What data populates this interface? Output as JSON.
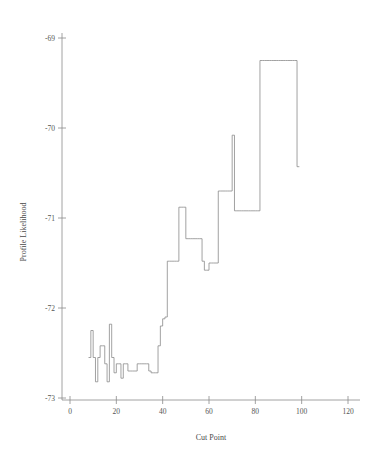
{
  "chart_data": {
    "type": "line",
    "title": "",
    "xlabel": "Cut Point",
    "ylabel": "Profile Likelihood",
    "xlim": [
      -4,
      128
    ],
    "ylim": [
      -73.2,
      -68.8
    ],
    "xticks": [
      0,
      20,
      40,
      60,
      80,
      100,
      120
    ],
    "xticklabels": [
      "0",
      "20",
      "40",
      "60",
      "80",
      "100",
      "120"
    ],
    "yticks": [
      -69,
      -70,
      -71,
      -72,
      -73
    ],
    "yticklabels": [
      "-69",
      "-70",
      "-71",
      "-72",
      "-73"
    ],
    "grid": false,
    "legend": false,
    "line_color": "#8a8a8a",
    "step_style": "post",
    "x": [
      8,
      9,
      10,
      11,
      12,
      13,
      14,
      15,
      16,
      17,
      18,
      19,
      20,
      21,
      22,
      23,
      24,
      25,
      26,
      27,
      28,
      29,
      30,
      31,
      32,
      33,
      34,
      35,
      36,
      37,
      38,
      39,
      40,
      41,
      42,
      43,
      44,
      45,
      46,
      47,
      48,
      49,
      50,
      51,
      52,
      53,
      54,
      55,
      56,
      57,
      58,
      59,
      60,
      61,
      62,
      63,
      64,
      65,
      66,
      67,
      68,
      69,
      70,
      71,
      72,
      73,
      74,
      75,
      76,
      77,
      78,
      79,
      80,
      81,
      82,
      83,
      84,
      85,
      86,
      87,
      88,
      89,
      90,
      91,
      92,
      93,
      94,
      95,
      96,
      97,
      98,
      99
    ],
    "y": [
      -72.55,
      -72.25,
      -72.55,
      -72.82,
      -72.55,
      -72.42,
      -72.42,
      -72.62,
      -72.82,
      -72.18,
      -72.55,
      -72.72,
      -72.62,
      -72.62,
      -72.78,
      -72.62,
      -72.62,
      -72.7,
      -72.7,
      -72.7,
      -72.7,
      -72.62,
      -72.62,
      -72.62,
      -72.62,
      -72.62,
      -72.7,
      -72.72,
      -72.72,
      -72.72,
      -72.42,
      -72.2,
      -72.12,
      -72.1,
      -71.48,
      -71.48,
      -71.48,
      -71.48,
      -71.48,
      -70.88,
      -70.88,
      -70.88,
      -71.23,
      -71.23,
      -71.23,
      -71.23,
      -71.23,
      -71.23,
      -71.23,
      -71.48,
      -71.58,
      -71.58,
      -71.5,
      -71.5,
      -71.5,
      -71.5,
      -70.7,
      -70.7,
      -70.7,
      -70.7,
      -70.7,
      -70.7,
      -70.08,
      -70.92,
      -70.92,
      -70.92,
      -70.92,
      -70.92,
      -70.92,
      -70.92,
      -70.92,
      -70.92,
      -70.92,
      -70.92,
      -69.25,
      -69.25,
      -69.25,
      -69.25,
      -69.25,
      -69.25,
      -69.25,
      -69.25,
      -69.25,
      -69.25,
      -69.25,
      -69.25,
      -69.25,
      -69.25,
      -69.25,
      -69.25,
      -70.43,
      -70.43
    ],
    "series": [
      {
        "name": "Profile Likelihood",
        "values": [
          -72.55,
          -72.25,
          -72.55,
          -72.82,
          -72.55,
          -72.42,
          -72.42,
          -72.62,
          -72.82,
          -72.18,
          -72.55,
          -72.72,
          -72.62,
          -72.62,
          -72.78,
          -72.62,
          -72.62,
          -72.7,
          -72.7,
          -72.7,
          -72.7,
          -72.62,
          -72.62,
          -72.62,
          -72.62,
          -72.62,
          -72.7,
          -72.72,
          -72.72,
          -72.72,
          -72.42,
          -72.2,
          -72.12,
          -72.1,
          -71.48,
          -71.48,
          -71.48,
          -71.48,
          -71.48,
          -70.88,
          -70.88,
          -70.88,
          -71.23,
          -71.23,
          -71.23,
          -71.23,
          -71.23,
          -71.23,
          -71.23,
          -71.48,
          -71.58,
          -71.58,
          -71.5,
          -71.5,
          -71.5,
          -71.5,
          -70.7,
          -70.7,
          -70.7,
          -70.7,
          -70.7,
          -70.7,
          -70.08,
          -70.92,
          -70.92,
          -70.92,
          -70.92,
          -70.92,
          -70.92,
          -70.92,
          -70.92,
          -70.92,
          -70.92,
          -70.92,
          -69.25,
          -69.25,
          -69.25,
          -69.25,
          -69.25,
          -69.25,
          -69.25,
          -69.25,
          -69.25,
          -69.25,
          -69.25,
          -69.25,
          -69.25,
          -69.25,
          -69.25,
          -69.25,
          -70.43,
          -70.43
        ]
      }
    ],
    "annotations": []
  }
}
